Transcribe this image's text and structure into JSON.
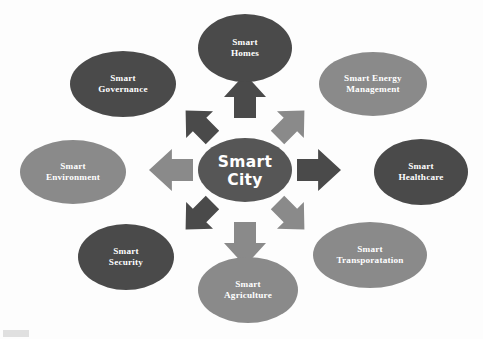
{
  "diagram": {
    "type": "radial-hub-and-spoke",
    "title": "Smart City",
    "background_color": "#fdfdfd",
    "colors": {
      "dark": "#4a4a4a",
      "medium": "#8a8a8a",
      "center": "#565656",
      "label_text": "#ffffff"
    },
    "center": {
      "id": "smart-city",
      "line1": "Smart",
      "line2": "City",
      "color": "#565656",
      "cx": 245,
      "cy": 170,
      "rx": 47,
      "ry": 32
    },
    "nodes": [
      {
        "id": "smart-homes",
        "line1": "Smart",
        "line2": "Homes",
        "direction": "north",
        "tone": "dark",
        "color": "#4a4a4a",
        "cx": 245,
        "cy": 48,
        "rx": 47,
        "ry": 34
      },
      {
        "id": "smart-energy-management",
        "line1": "Smart Energy",
        "line2": "Management",
        "direction": "northeast",
        "tone": "medium",
        "color": "#8a8a8a",
        "cx": 373,
        "cy": 84,
        "rx": 54,
        "ry": 32
      },
      {
        "id": "smart-healthcare",
        "line1": "Smart",
        "line2": "Healthcare",
        "direction": "east",
        "tone": "dark",
        "color": "#4a4a4a",
        "cx": 421,
        "cy": 172,
        "rx": 47,
        "ry": 33
      },
      {
        "id": "smart-transporatation",
        "line1": "Smart",
        "line2": "Transporatation",
        "direction": "southeast",
        "tone": "medium",
        "color": "#8a8a8a",
        "cx": 370,
        "cy": 255,
        "rx": 57,
        "ry": 33
      },
      {
        "id": "smart-agriculture",
        "line1": "Smart",
        "line2": "Agriculture",
        "direction": "south",
        "tone": "medium",
        "color": "#8a8a8a",
        "cx": 248,
        "cy": 290,
        "rx": 50,
        "ry": 33
      },
      {
        "id": "smart-security",
        "line1": "Smart",
        "line2": "Security",
        "direction": "southwest",
        "tone": "dark",
        "color": "#4a4a4a",
        "cx": 126,
        "cy": 257,
        "rx": 48,
        "ry": 33
      },
      {
        "id": "smart-environment",
        "line1": "Smart",
        "line2": "Environment",
        "direction": "west",
        "tone": "medium",
        "color": "#8a8a8a",
        "cx": 73,
        "cy": 172,
        "rx": 53,
        "ry": 32
      },
      {
        "id": "smart-governance",
        "line1": "Smart",
        "line2": "Governance",
        "direction": "northwest",
        "tone": "dark",
        "color": "#4a4a4a",
        "cx": 123,
        "cy": 84,
        "rx": 53,
        "ry": 33
      }
    ],
    "arrows": [
      {
        "id": "arrow-north",
        "direction": "north",
        "points_to": "smart-homes",
        "tone": "dark",
        "color": "#4a4a4a",
        "angle": -90
      },
      {
        "id": "arrow-northeast",
        "direction": "northeast",
        "points_to": "smart-energy-management",
        "tone": "medium",
        "color": "#8a8a8a",
        "angle": -45
      },
      {
        "id": "arrow-east",
        "direction": "east",
        "points_to": "smart-healthcare",
        "tone": "dark",
        "color": "#4a4a4a",
        "angle": 0
      },
      {
        "id": "arrow-southeast",
        "direction": "southeast",
        "points_to": "smart-transporatation",
        "tone": "medium",
        "color": "#8a8a8a",
        "angle": 45
      },
      {
        "id": "arrow-south",
        "direction": "south",
        "points_to": "smart-agriculture",
        "tone": "medium",
        "color": "#8a8a8a",
        "angle": 90
      },
      {
        "id": "arrow-southwest",
        "direction": "southwest",
        "points_to": "smart-security",
        "tone": "dark",
        "color": "#4a4a4a",
        "angle": 135
      },
      {
        "id": "arrow-west",
        "direction": "west",
        "points_to": "smart-environment",
        "tone": "medium",
        "color": "#8a8a8a",
        "angle": 180
      },
      {
        "id": "arrow-northwest",
        "direction": "northwest",
        "points_to": "smart-governance",
        "tone": "dark",
        "color": "#4a4a4a",
        "angle": -135
      }
    ]
  }
}
